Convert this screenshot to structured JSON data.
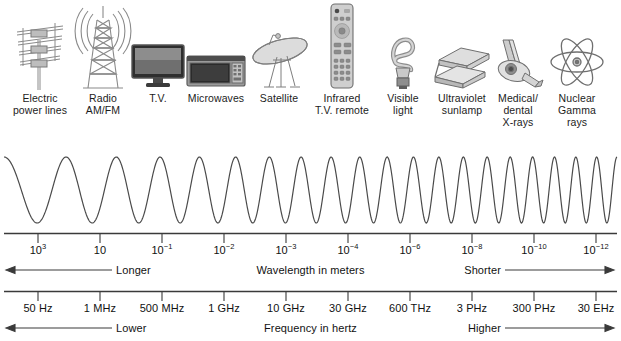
{
  "chart_data": {
    "type": "line",
    "xlabel": "Wavelength in meters",
    "secondary_xlabel": "Frequency in hertz",
    "grid": false,
    "legend": "none",
    "wave": {
      "description": "Continuous sine wave whose frequency increases left to right, illustrating decreasing wavelength",
      "cycles_total": 20,
      "amplitude_px": 33
    },
    "wavelength_axis": {
      "label": "Wavelength in meters",
      "left_arrow_text": "Longer",
      "right_arrow_text": "Shorter",
      "ticks": [
        {
          "base": "10",
          "exponent": "3",
          "x": 38
        },
        {
          "base": "10",
          "exponent": "",
          "x": 100
        },
        {
          "base": "10",
          "exponent": "-1",
          "x": 162
        },
        {
          "base": "10",
          "exponent": "-2",
          "x": 224
        },
        {
          "base": "10",
          "exponent": "-3",
          "x": 286
        },
        {
          "base": "10",
          "exponent": "-4",
          "x": 348
        },
        {
          "base": "10",
          "exponent": "-6",
          "x": 410
        },
        {
          "base": "10",
          "exponent": "-8",
          "x": 472
        },
        {
          "base": "10",
          "exponent": "-10",
          "x": 534
        },
        {
          "base": "10",
          "exponent": "-12",
          "x": 596
        }
      ]
    },
    "frequency_axis": {
      "label": "Frequency in hertz",
      "left_arrow_text": "Lower",
      "right_arrow_text": "Higher",
      "ticks": [
        {
          "text": "50 Hz",
          "x": 38
        },
        {
          "text": "1 MHz",
          "x": 100
        },
        {
          "text": "500 MHz",
          "x": 162
        },
        {
          "text": "1 GHz",
          "x": 224
        },
        {
          "text": "10 GHz",
          "x": 286
        },
        {
          "text": "30 GHz",
          "x": 348
        },
        {
          "text": "600 THz",
          "x": 410
        },
        {
          "text": "3 PHz",
          "x": 472
        },
        {
          "text": "300 PHz",
          "x": 534
        },
        {
          "text": "30 EHz",
          "x": 596
        }
      ]
    },
    "sources": [
      {
        "icon": "transmission-tower-icon",
        "lines": [
          "Electric",
          "power lines"
        ],
        "x": 40
      },
      {
        "icon": "radio-tower-icon",
        "lines": [
          "Radio",
          "AM/FM"
        ],
        "x": 103
      },
      {
        "icon": "television-icon",
        "lines": [
          "T.V."
        ],
        "x": 158
      },
      {
        "icon": "microwave-oven-icon",
        "lines": [
          "Microwaves"
        ],
        "x": 216
      },
      {
        "icon": "satellite-dish-icon",
        "lines": [
          "Satellite"
        ],
        "x": 279
      },
      {
        "icon": "tv-remote-icon",
        "lines": [
          "Infrared",
          "T.V. remote"
        ],
        "x": 342
      },
      {
        "icon": "cfl-bulb-icon",
        "lines": [
          "Visible",
          "light"
        ],
        "x": 403
      },
      {
        "icon": "sunlamp-icon",
        "lines": [
          "Ultraviolet",
          "sunlamp"
        ],
        "x": 462
      },
      {
        "icon": "xray-machine-icon",
        "lines": [
          "Medical/",
          "dental",
          "X-rays"
        ],
        "x": 518
      },
      {
        "icon": "atom-icon",
        "lines": [
          "Nuclear",
          "Gamma",
          "rays"
        ],
        "x": 577
      }
    ]
  },
  "colors": {
    "background": "#ffffff",
    "text": "#1a1a1a",
    "axis_line": "#3a3a3a",
    "wave_line": "#4a4a4a",
    "icon_stroke": "#808080",
    "icon_fill": "#d8d8d8"
  }
}
